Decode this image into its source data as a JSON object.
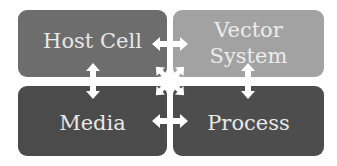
{
  "diagram": {
    "nodes": [
      {
        "id": "host",
        "label": "Host Cell",
        "color": "#6d6d6d"
      },
      {
        "id": "vector",
        "label": "Vector System",
        "line1": "Vector",
        "line2": "System",
        "color": "#a2a2a2"
      },
      {
        "id": "media",
        "label": "Media",
        "color": "#4b4b4b"
      },
      {
        "id": "process",
        "label": "Process",
        "color": "#4d4d4d"
      }
    ],
    "edges": [
      {
        "from": "host",
        "to": "vector",
        "type": "bidirectional"
      },
      {
        "from": "host",
        "to": "media",
        "type": "bidirectional"
      },
      {
        "from": "vector",
        "to": "process",
        "type": "bidirectional"
      },
      {
        "from": "media",
        "to": "process",
        "type": "bidirectional"
      },
      {
        "from": "host",
        "to": "process",
        "type": "bidirectional"
      },
      {
        "from": "vector",
        "to": "media",
        "type": "bidirectional"
      }
    ],
    "arrow_color": "#ffffff",
    "background": "#ffffff"
  }
}
